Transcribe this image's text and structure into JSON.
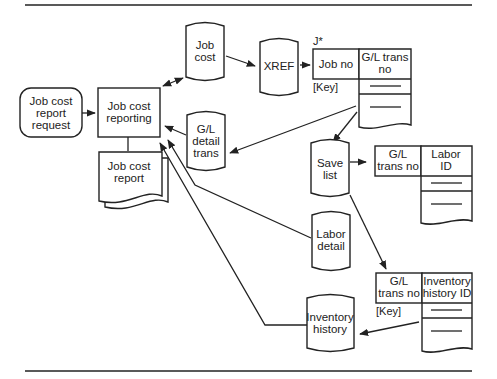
{
  "diagram": {
    "type": "data-flow",
    "nodes": {
      "request": {
        "kind": "terminator",
        "lines": [
          "Job cost",
          "report",
          "request"
        ]
      },
      "process": {
        "kind": "process",
        "lines": [
          "Job cost",
          "reporting"
        ]
      },
      "report": {
        "kind": "document",
        "lines": [
          "Job cost",
          "report"
        ]
      },
      "job_cost": {
        "kind": "data-store",
        "lines": [
          "Job",
          "cost"
        ]
      },
      "gl_detail": {
        "kind": "data-store",
        "lines": [
          "G/L",
          "detail",
          "trans"
        ]
      },
      "xref": {
        "kind": "data-store",
        "lines": [
          "XREF"
        ]
      },
      "save_list": {
        "kind": "data-store",
        "lines": [
          "Save",
          "list"
        ]
      },
      "labor_detail": {
        "kind": "data-store",
        "lines": [
          "Labor",
          "detail"
        ]
      },
      "inventory_history": {
        "kind": "data-store",
        "lines": [
          "Inventory",
          "history"
        ]
      }
    },
    "tables": {
      "xref_table": {
        "marker": "J*",
        "key_label": "[Key]",
        "col1": [
          "Job no"
        ],
        "col2": [
          "G/L trans",
          "no"
        ]
      },
      "labor_table": {
        "col1": [
          "G/L",
          "trans no"
        ],
        "col2": [
          "Labor",
          "ID"
        ]
      },
      "inventory_table": {
        "key_label": "[Key]",
        "col1": [
          "G/L",
          "trans no"
        ],
        "col2": [
          "Inventory",
          "history ID"
        ]
      }
    },
    "edges": [
      {
        "from": "request",
        "to": "process"
      },
      {
        "from": "process",
        "to": "job_cost",
        "bidirectional": true
      },
      {
        "from": "job_cost",
        "to": "xref"
      },
      {
        "from": "xref",
        "to": "xref_table"
      },
      {
        "from": "xref_table",
        "to": "gl_detail"
      },
      {
        "from": "xref_table",
        "to": "save_list"
      },
      {
        "from": "gl_detail",
        "to": "process"
      },
      {
        "from": "save_list",
        "to": "labor_table"
      },
      {
        "from": "save_list",
        "to": "inventory_table"
      },
      {
        "from": "labor_detail",
        "to": "process"
      },
      {
        "from": "inventory_table",
        "to": "inventory_history"
      },
      {
        "from": "inventory_history",
        "to": "process"
      },
      {
        "from": "process",
        "to": "report"
      }
    ]
  }
}
